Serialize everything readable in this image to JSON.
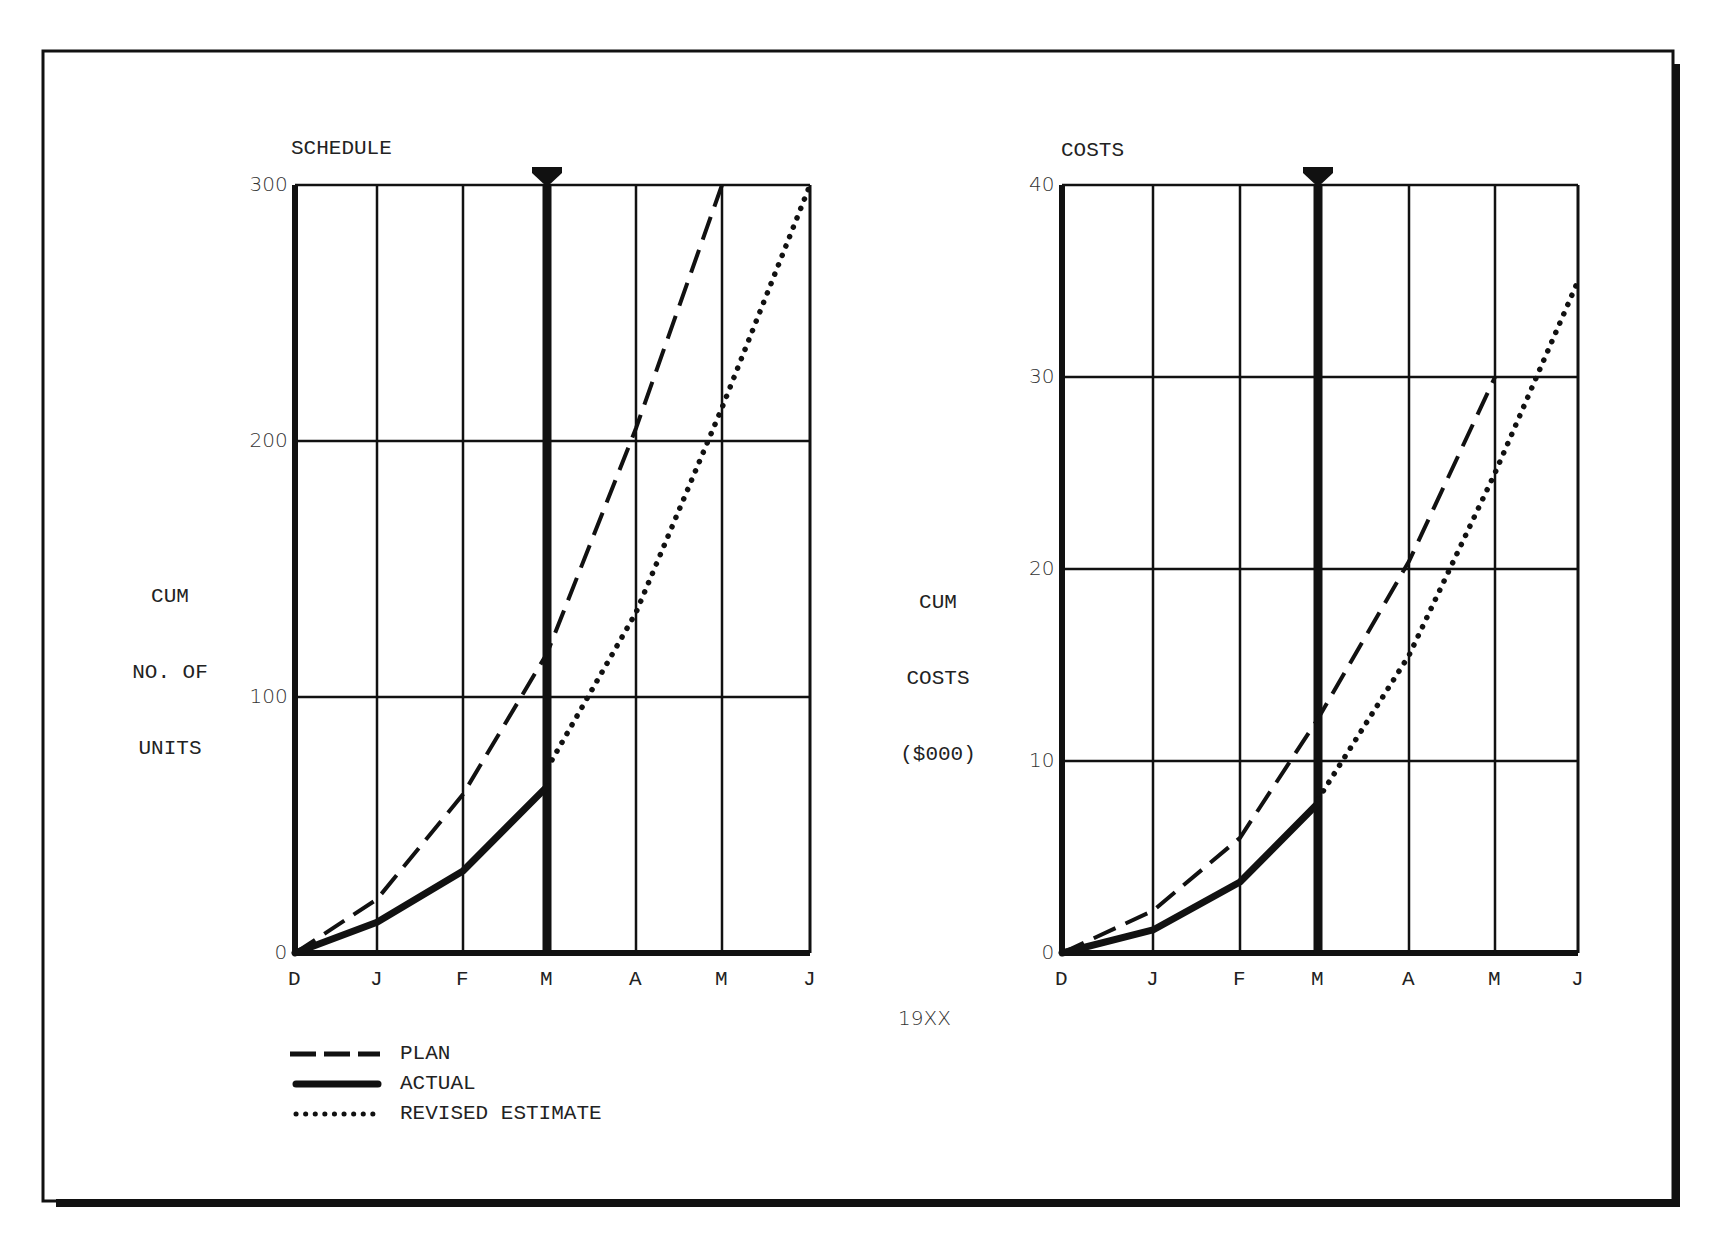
{
  "figure": {
    "center_label": "19XX",
    "legend": [
      {
        "label": "PLAN",
        "style": "dashed"
      },
      {
        "label": "ACTUAL",
        "style": "solid"
      },
      {
        "label": "REVISED ESTIMATE",
        "style": "dotted"
      }
    ]
  },
  "chart_data": [
    {
      "type": "line",
      "title": "SCHEDULE",
      "xlabel": "",
      "ylabel": "CUM NO. OF UNITS",
      "ylabel_lines": [
        "CUM",
        "NO. OF",
        "UNITS"
      ],
      "categories": [
        "D",
        "J",
        "F",
        "M",
        "A",
        "M",
        "J"
      ],
      "ylim": [
        0,
        300
      ],
      "yticks": [
        0,
        100,
        200,
        300
      ],
      "grid": true,
      "status_date_marker": "M",
      "series": [
        {
          "name": "PLAN",
          "style": "dashed",
          "values": [
            0,
            21,
            62,
            117,
            205,
            300,
            null
          ]
        },
        {
          "name": "ACTUAL",
          "style": "solid",
          "values": [
            0,
            12,
            32,
            65,
            null,
            null,
            null
          ]
        },
        {
          "name": "REVISED ESTIMATE",
          "style": "dotted",
          "values": [
            null,
            null,
            null,
            72,
            133,
            213,
            300
          ]
        }
      ]
    },
    {
      "type": "line",
      "title": "COSTS",
      "xlabel": "",
      "ylabel": "CUM COSTS ($000)",
      "ylabel_lines": [
        "CUM",
        "COSTS",
        "($000)"
      ],
      "categories": [
        "D",
        "J",
        "F",
        "M",
        "A",
        "M",
        "J"
      ],
      "ylim": [
        0,
        40
      ],
      "yticks": [
        0,
        10,
        20,
        30,
        40
      ],
      "grid": true,
      "status_date_marker": "M",
      "series": [
        {
          "name": "PLAN",
          "style": "dashed",
          "values": [
            0,
            2.2,
            6,
            12.2,
            20.4,
            30,
            null
          ]
        },
        {
          "name": "ACTUAL",
          "style": "solid",
          "values": [
            0,
            1.2,
            3.7,
            7.8,
            null,
            null,
            null
          ]
        },
        {
          "name": "REVISED ESTIMATE",
          "style": "dotted",
          "values": [
            null,
            null,
            null,
            8,
            15.5,
            25,
            35
          ]
        }
      ]
    }
  ],
  "xlabel_shared": "19XX",
  "colors": {
    "ink": "#111111",
    "paper": "#ffffff"
  }
}
